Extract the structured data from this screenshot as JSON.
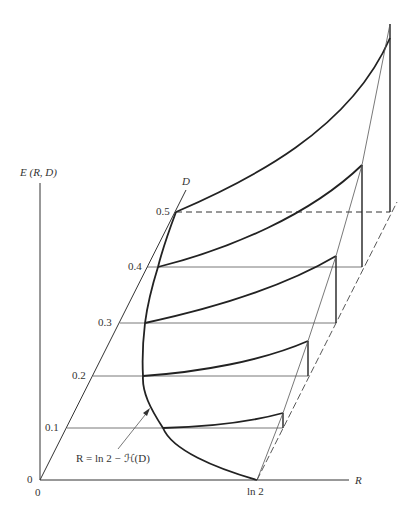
{
  "diagram": {
    "y_axis_label": "E (R, D)",
    "x_axis_label": "R",
    "d_axis_label": "D",
    "origin_label_y": "0",
    "origin_label_x": "0",
    "ln2_label": "ln 2",
    "d_ticks": [
      "0.1",
      "0.2",
      "0.3",
      "0.4",
      "0.5"
    ],
    "curve_annotation": "R = ln 2 − ℋ(D)",
    "colors": {
      "ink": "#222222",
      "background": "#ffffff"
    }
  }
}
